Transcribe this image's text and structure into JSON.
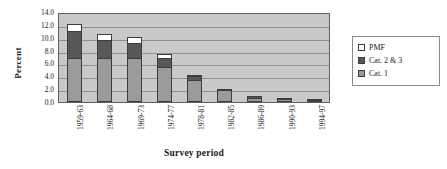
{
  "chart_data": {
    "type": "bar",
    "stacked": true,
    "title": "",
    "xlabel": "Survey period",
    "ylabel": "Percent",
    "ylim": [
      0.0,
      14.0
    ],
    "ytick_step": 2.0,
    "ytick_labels": [
      "14.0",
      "12.0",
      "10.0",
      "8.0",
      "6.0",
      "4.0",
      "2.0",
      "0.0"
    ],
    "ytick_values": [
      14.0,
      12.0,
      10.0,
      8.0,
      6.0,
      4.0,
      2.0,
      0.0
    ],
    "grid": true,
    "legend_position": "right",
    "categories": [
      "1959-63",
      "1964-68",
      "1969-73",
      "1974-77",
      "1978-81",
      "1982-85",
      "1986-89",
      "1990-93",
      "1994-97"
    ],
    "series": [
      {
        "name": "Cat. 1",
        "color": "#9b9b9b",
        "values": [
          6.9,
          6.8,
          6.9,
          5.5,
          3.5,
          1.8,
          0.7,
          0.4,
          0.25
        ]
      },
      {
        "name": "Cat. 2 & 3",
        "color": "#585858",
        "values": [
          4.2,
          2.8,
          2.3,
          1.4,
          0.5,
          0.25,
          0.1,
          0.05,
          0.05
        ]
      },
      {
        "name": "PMF",
        "color": "#ffffff",
        "values": [
          1.0,
          1.0,
          0.9,
          0.6,
          0.2,
          0.0,
          0.0,
          0.0,
          0.0
        ]
      }
    ],
    "totals": [
      12.1,
      10.6,
      10.1,
      7.5,
      4.2,
      2.05,
      0.8,
      0.45,
      0.3
    ]
  },
  "legend": {
    "entries": [
      {
        "label": "PMF",
        "color": "#ffffff"
      },
      {
        "label": "Cat. 2 & 3",
        "color": "#585858"
      },
      {
        "label": "Cat. 1",
        "color": "#9b9b9b"
      }
    ]
  },
  "colors": {
    "plot_background": "#c9c9c9",
    "gridline": "#8e8e8e",
    "axis": "#5e5e5e",
    "bar_outline": "#3d3d3d"
  }
}
